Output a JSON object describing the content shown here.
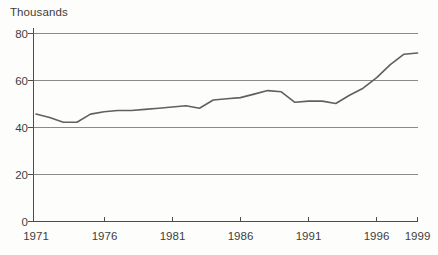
{
  "figure": {
    "unit_label": "Thousands"
  },
  "chart_data": {
    "type": "line",
    "title": "",
    "unit_label": "Thousands",
    "xlabel": "",
    "ylabel": "Thousands",
    "x": [
      1971,
      1972,
      1973,
      1974,
      1975,
      1976,
      1977,
      1978,
      1979,
      1980,
      1981,
      1982,
      1983,
      1984,
      1985,
      1986,
      1987,
      1988,
      1989,
      1990,
      1991,
      1992,
      1993,
      1994,
      1995,
      1996,
      1997,
      1998,
      1999
    ],
    "values": [
      45.5,
      44,
      42,
      42,
      45.5,
      46.5,
      47,
      47,
      47.5,
      48,
      48.5,
      49,
      48,
      51.5,
      52,
      52.5,
      54,
      55.5,
      55,
      50.5,
      51,
      51,
      50,
      53.5,
      56.5,
      61,
      66.5,
      71,
      71.5
    ],
    "xlim": [
      1971,
      1999
    ],
    "ylim": [
      0,
      80
    ],
    "yticks": [
      0,
      20,
      40,
      60,
      80
    ],
    "ytick_labels_topdown": [
      "80",
      "60",
      "40",
      "20",
      "0"
    ],
    "xticks": [
      1971,
      1976,
      1981,
      1986,
      1991,
      1996,
      1999
    ],
    "xtick_labels": [
      "1971",
      "1976",
      "1981",
      "1986",
      "1991",
      "1996",
      "1999"
    ],
    "grid": "horizontal",
    "legend": "none",
    "series_name": "",
    "line_color": "#606060",
    "gridline_color": "#8a8a8a",
    "axis_color": "#4d4d4d",
    "text_color": "#3d3d3d"
  }
}
